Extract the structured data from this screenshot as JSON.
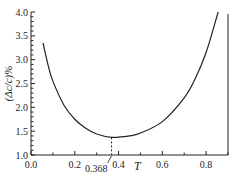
{
  "chart_data": {
    "type": "line",
    "title": "",
    "xlabel": "T",
    "ylabel": "(Δc/c)%",
    "xlim": [
      0.0,
      0.9
    ],
    "ylim": [
      1.0,
      4.0
    ],
    "x_ticks": [
      "0.0",
      "0.2",
      "0.4",
      "0.6",
      "0.8"
    ],
    "y_ticks": [
      "1.0",
      "1.5",
      "2.0",
      "2.5",
      "3.0",
      "3.5",
      "4.0"
    ],
    "grid": false,
    "annotations": [
      {
        "text": "0.368",
        "x": 0.368,
        "y": 1.37,
        "note": "minimum marked with dashed vertical line"
      }
    ],
    "series": [
      {
        "name": "(Δc/c)%",
        "x": [
          0.055,
          0.08,
          0.1,
          0.15,
          0.2,
          0.25,
          0.3,
          0.368,
          0.45,
          0.5,
          0.6,
          0.7,
          0.75,
          0.8,
          0.855
        ],
        "values": [
          3.35,
          2.85,
          2.55,
          2.05,
          1.75,
          1.56,
          1.44,
          1.37,
          1.4,
          1.46,
          1.7,
          2.2,
          2.6,
          3.15,
          4.0
        ]
      }
    ]
  }
}
